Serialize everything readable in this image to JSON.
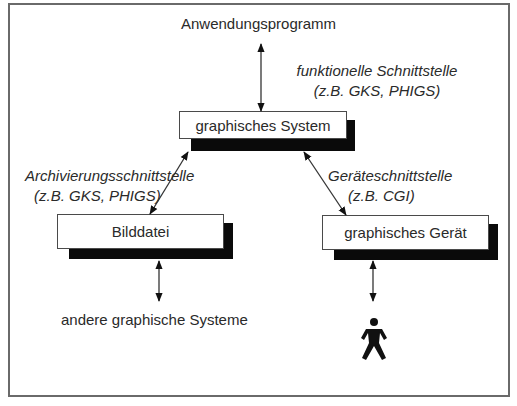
{
  "diagram": {
    "top_label": "Anwendungsprogramm",
    "functional_interface": {
      "line1": "funktionelle Schnittstelle",
      "line2": "(z.B. GKS, PHIGS)"
    },
    "archive_interface": {
      "line1": "Archivierungsschnittstelle",
      "line2": "(z.B. GKS, PHIGS)"
    },
    "device_interface": {
      "line1": "Geräteschnittstelle",
      "line2": "(z.B. CGI)"
    },
    "nodes": {
      "system": "graphisches System",
      "file": "Bilddatei",
      "device": "graphisches Gerät"
    },
    "bottom_left_label": "andere graphische Systeme",
    "user_icon": "person-icon",
    "colors": {
      "frame": "#6a6a6a",
      "shadow": "#0a0a0a",
      "text": "#2a2a2a",
      "arrow": "#222222"
    }
  }
}
